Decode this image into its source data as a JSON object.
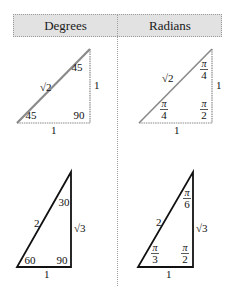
{
  "header": {
    "columns": [
      {
        "label": "Degrees"
      },
      {
        "label": "Radians"
      }
    ]
  },
  "triangles": {
    "deg_45": {
      "hypotenuse": "√2",
      "vertical_side": "1",
      "base": "1",
      "angle_top": "45",
      "angle_bottom_left": "45",
      "angle_right": "90"
    },
    "rad_45": {
      "hypotenuse": "√2",
      "vertical_side": "1",
      "base": "1",
      "angle_top": {
        "num": "π",
        "den": "4"
      },
      "angle_bottom_left": {
        "num": "π",
        "den": "4"
      },
      "angle_right": {
        "num": "π",
        "den": "2"
      }
    },
    "deg_30_60": {
      "hypotenuse": "2",
      "vertical_side": "√3",
      "base": "1",
      "angle_top": "30",
      "angle_bottom_left": "60",
      "angle_right": "90"
    },
    "rad_30_60": {
      "hypotenuse": "2",
      "vertical_side": "√3",
      "base": "1",
      "angle_top": {
        "num": "π",
        "den": "6"
      },
      "angle_bottom_left": {
        "num": "π",
        "den": "3"
      },
      "angle_right": {
        "num": "π",
        "den": "2"
      }
    }
  },
  "colors": {
    "header_bg": "#e2e2e2",
    "divider": "#a0a0a0",
    "light_stroke": "#8a8a8a",
    "dark_stroke": "#111111"
  }
}
